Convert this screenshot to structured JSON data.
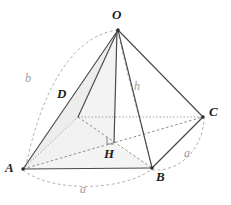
{
  "figure": {
    "background_color": "#ffffff",
    "stroke_color": "#3a3a3a",
    "hidden_stroke_color": "#9b9b9b",
    "arc_color": "#b0b0b0",
    "face_fill": "#eeeeee",
    "label_color": "#1d1d1d",
    "measure_color": "#9a9a9a"
  },
  "vertices": [
    {
      "name": "O",
      "label": "O",
      "x": 118,
      "y": 30,
      "label_x": 112,
      "label_y": 10,
      "hidden": false,
      "role": "apex"
    },
    {
      "name": "A",
      "label": "A",
      "x": 23,
      "y": 169,
      "label_x": 6,
      "label_y": 163,
      "hidden": false,
      "role": "base-front-left"
    },
    {
      "name": "B",
      "label": "B",
      "x": 152,
      "y": 168,
      "label_x": 156,
      "label_y": 172,
      "hidden": false,
      "role": "base-front-right"
    },
    {
      "name": "C",
      "label": "C",
      "x": 203,
      "y": 117,
      "label_x": 209,
      "label_y": 106,
      "hidden": false,
      "role": "base-back-right"
    },
    {
      "name": "D",
      "label": "D",
      "x": 78,
      "y": 117,
      "label_x": 57,
      "label_y": 86,
      "hidden": true,
      "role": "base-back-left"
    },
    {
      "name": "H",
      "label": "H",
      "x": 113,
      "y": 143,
      "label_x": 105,
      "label_y": 149,
      "hidden": false,
      "role": "foot-of-altitude"
    }
  ],
  "measures": [
    {
      "name": "b",
      "label": "b",
      "x": 26,
      "y": 73,
      "description": "lateral edge arc radius"
    },
    {
      "name": "h",
      "label": "h",
      "x": 134,
      "y": 81,
      "description": "pyramid height"
    },
    {
      "name": "a_right",
      "label": "a",
      "x": 184,
      "y": 148,
      "description": "base edge BC"
    },
    {
      "name": "a_bottom",
      "label": "a",
      "x": 80,
      "y": 184,
      "description": "base edge AB"
    }
  ],
  "edges": [
    {
      "name": "edge-OA",
      "from": "O",
      "to": "A",
      "style": "solid"
    },
    {
      "name": "edge-OB",
      "from": "O",
      "to": "B",
      "style": "solid"
    },
    {
      "name": "edge-OC",
      "from": "O",
      "to": "C",
      "style": "solid"
    },
    {
      "name": "edge-OD",
      "from": "O",
      "to": "D",
      "style": "solid"
    },
    {
      "name": "edge-AB",
      "from": "A",
      "to": "B",
      "style": "solid"
    },
    {
      "name": "edge-BC",
      "from": "B",
      "to": "C",
      "style": "solid"
    },
    {
      "name": "edge-AD",
      "from": "A",
      "to": "D",
      "style": "dotted"
    },
    {
      "name": "edge-DC",
      "from": "D",
      "to": "C",
      "style": "dotted"
    },
    {
      "name": "altitude-OH",
      "from": "O",
      "to": "H",
      "style": "solid"
    },
    {
      "name": "diagonal-AC",
      "from": "A",
      "to": "C",
      "style": "dashed"
    },
    {
      "name": "diagonal-DB",
      "from": "D",
      "to": "B",
      "style": "dashed"
    }
  ],
  "faces": [
    {
      "name": "face-AOD",
      "vertices": [
        "A",
        "O",
        "D"
      ],
      "shaded": true
    },
    {
      "name": "face-ADH",
      "vertices": [
        "A",
        "D",
        "H"
      ],
      "shaded": true
    },
    {
      "name": "face-AHB",
      "vertices": [
        "A",
        "H",
        "B"
      ],
      "shaded": true
    }
  ],
  "arcs": [
    {
      "name": "arc-b-left",
      "description": "dashed arc of radius b from O sweeping to A"
    },
    {
      "name": "arc-a-bottom",
      "description": "dashed arc of radius a below edge AB"
    },
    {
      "name": "arc-a-right",
      "description": "dashed arc of radius a outside edge BC"
    },
    {
      "name": "arc-inner-OB",
      "description": "dashed arc from O curving to B"
    }
  ],
  "markers": [
    {
      "name": "right-angle-at-H",
      "x": 107,
      "y": 136,
      "size": 7,
      "description": "right angle between altitude OH and base"
    }
  ]
}
